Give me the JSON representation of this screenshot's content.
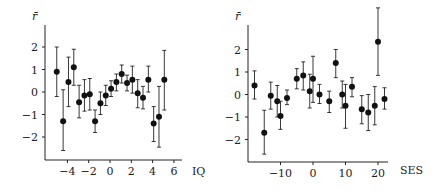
{
  "chart_data": [
    {
      "type": "scatter",
      "title": "",
      "xlabel": "IQ",
      "ylabel": "r̄",
      "xticks": [
        -4,
        -2,
        0,
        2,
        4,
        6
      ],
      "yticks": [
        -2,
        -1,
        0,
        1,
        2
      ],
      "xlim": [
        -5.8,
        6.7
      ],
      "ylim": [
        -3.0,
        2.9
      ],
      "error_bars": true,
      "points": [
        {
          "x": -5.0,
          "y": 0.9,
          "hi": 2.0,
          "lo": -0.2
        },
        {
          "x": -4.4,
          "y": -1.3,
          "hi": 0.1,
          "lo": -2.6
        },
        {
          "x": -3.9,
          "y": 0.45,
          "hi": 1.55,
          "lo": -0.65
        },
        {
          "x": -3.4,
          "y": 1.1,
          "hi": 1.9,
          "lo": 0.3
        },
        {
          "x": -2.9,
          "y": -0.45,
          "hi": 0.3,
          "lo": -1.15
        },
        {
          "x": -2.4,
          "y": -0.15,
          "hi": 0.55,
          "lo": -0.85
        },
        {
          "x": -1.9,
          "y": -0.1,
          "hi": 0.6,
          "lo": -0.8
        },
        {
          "x": -1.4,
          "y": -1.3,
          "hi": -0.8,
          "lo": -1.8
        },
        {
          "x": -0.9,
          "y": -0.5,
          "hi": 0.0,
          "lo": -1.0
        },
        {
          "x": -0.4,
          "y": -0.15,
          "hi": 0.3,
          "lo": -0.6
        },
        {
          "x": 0.1,
          "y": 0.15,
          "hi": 0.5,
          "lo": -0.2
        },
        {
          "x": 0.6,
          "y": 0.45,
          "hi": 0.8,
          "lo": 0.05
        },
        {
          "x": 1.1,
          "y": 0.8,
          "hi": 1.2,
          "lo": 0.4
        },
        {
          "x": 1.6,
          "y": 0.4,
          "hi": 0.75,
          "lo": 0.05
        },
        {
          "x": 2.1,
          "y": 0.55,
          "hi": 1.15,
          "lo": -0.05
        },
        {
          "x": 2.6,
          "y": -0.05,
          "hi": 0.55,
          "lo": -0.7
        },
        {
          "x": 3.1,
          "y": -0.25,
          "hi": 0.25,
          "lo": -0.75
        },
        {
          "x": 3.6,
          "y": 0.55,
          "hi": 1.15,
          "lo": 0.0
        },
        {
          "x": 4.1,
          "y": -1.4,
          "hi": -0.65,
          "lo": -2.2
        },
        {
          "x": 4.6,
          "y": -1.1,
          "hi": 0.25,
          "lo": -2.45
        },
        {
          "x": 5.1,
          "y": 0.55,
          "hi": 1.85,
          "lo": -0.8
        }
      ]
    },
    {
      "type": "scatter",
      "title": "",
      "xlabel": "SES",
      "ylabel": "r̄",
      "xticks": [
        -10,
        0,
        10,
        20
      ],
      "yticks": [
        -2,
        -1,
        0,
        1,
        2
      ],
      "xlim": [
        -20.5,
        23.5
      ],
      "ylim": [
        -3.0,
        3.9
      ],
      "error_bars": true,
      "points": [
        {
          "x": -18,
          "y": 0.4,
          "hi": 1.05,
          "lo": -0.2
        },
        {
          "x": -15,
          "y": -1.7,
          "hi": -0.7,
          "lo": -2.65
        },
        {
          "x": -13,
          "y": -0.05,
          "hi": 0.55,
          "lo": -0.65
        },
        {
          "x": -11,
          "y": -0.3,
          "hi": 0.4,
          "lo": -1.0
        },
        {
          "x": -10,
          "y": -0.95,
          "hi": -0.3,
          "lo": -1.55
        },
        {
          "x": -8,
          "y": -0.15,
          "hi": 0.2,
          "lo": -0.45
        },
        {
          "x": -5,
          "y": 0.7,
          "hi": 1.15,
          "lo": 0.25
        },
        {
          "x": -3,
          "y": 0.85,
          "hi": 1.45,
          "lo": 0.2
        },
        {
          "x": -1,
          "y": 0.15,
          "hi": 0.9,
          "lo": -0.6
        },
        {
          "x": 0,
          "y": 0.7,
          "hi": 1.7,
          "lo": -0.35
        },
        {
          "x": 2,
          "y": 0.0,
          "hi": 0.45,
          "lo": -0.4
        },
        {
          "x": 5,
          "y": -0.3,
          "hi": 0.15,
          "lo": -0.8
        },
        {
          "x": 7,
          "y": 1.4,
          "hi": 2.0,
          "lo": 0.75
        },
        {
          "x": 9,
          "y": 0.0,
          "hi": 0.6,
          "lo": -0.6
        },
        {
          "x": 10,
          "y": -0.5,
          "hi": 0.45,
          "lo": -1.5
        },
        {
          "x": 12,
          "y": 0.35,
          "hi": 0.75,
          "lo": -0.1
        },
        {
          "x": 15,
          "y": -0.65,
          "hi": -0.05,
          "lo": -1.3
        },
        {
          "x": 17,
          "y": -0.8,
          "hi": 0.0,
          "lo": -1.6
        },
        {
          "x": 19,
          "y": -0.5,
          "hi": 0.35,
          "lo": -1.35
        },
        {
          "x": 20,
          "y": 2.35,
          "hi": 3.85,
          "lo": 0.85
        },
        {
          "x": 22,
          "y": -0.2,
          "hi": 0.3,
          "lo": -0.65
        }
      ]
    }
  ],
  "layout": [
    {
      "x0px": 110,
      "xpx_per_unit": 10.65,
      "y0px": 92,
      "ypx_per_unit": 22.5,
      "axis_left": 45,
      "axis_bottom": 160,
      "axis_right": 182,
      "axis_top": 25,
      "label_x": 192,
      "label_y": 175
    },
    {
      "x0px": 313,
      "xpx_per_unit": 3.25,
      "y0px": 94.5,
      "ypx_per_unit": 22.5,
      "axis_left": 248,
      "axis_right": 388,
      "axis_bottom": 162,
      "axis_top": 25,
      "label_x": 400,
      "label_y": 174
    }
  ]
}
